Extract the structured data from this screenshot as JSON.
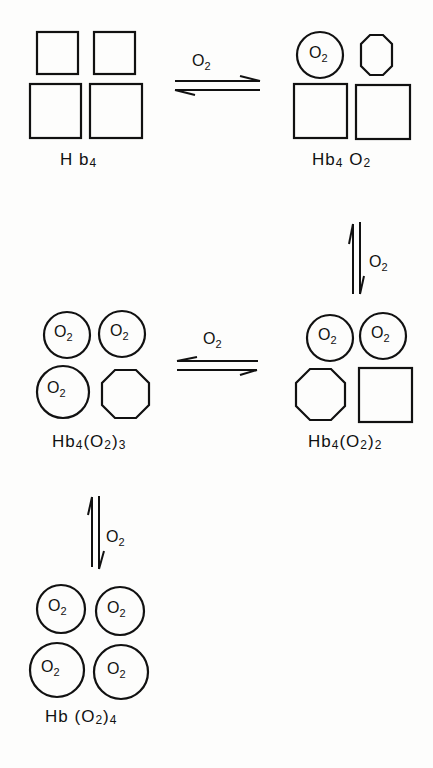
{
  "diagram": {
    "title": "",
    "species": [
      {
        "id": "hb4",
        "label": "Hb",
        "sub": "4",
        "label_full": "Hb4"
      },
      {
        "id": "hb4o2",
        "label_full": "Hb4 O2"
      },
      {
        "id": "hb4o2_2",
        "label_full": "Hb4(O2)2"
      },
      {
        "id": "hb4o2_3",
        "label_full": "Hb4(O2)3"
      },
      {
        "id": "hbo2_4",
        "label_full": "Hb(O2)4"
      }
    ],
    "arrows": [
      {
        "from": "Hb4",
        "to": "Hb4O2",
        "label": "O2",
        "type": "equilibrium"
      },
      {
        "from": "Hb4O2",
        "to": "Hb4(O2)2",
        "label": "O2",
        "type": "equilibrium"
      },
      {
        "from": "Hb4(O2)2",
        "to": "Hb4(O2)3",
        "label": "O2",
        "type": "equilibrium"
      },
      {
        "from": "Hb4(O2)3",
        "to": "Hb(O2)4",
        "label": "O2",
        "type": "equilibrium"
      }
    ],
    "text": {
      "O": "O",
      "two": "2",
      "Hb": "Hb",
      "H_b": "H b",
      "four": "4",
      "three": "3",
      "lp": "(",
      "rp": ")"
    },
    "legend": {
      "square": "deoxy subunit (T state)",
      "octagon": "unliganded subunit (R state)",
      "circle": "O2-bound subunit"
    },
    "colors": {
      "ink": "#111111",
      "paper": "#fdfdfc"
    }
  }
}
